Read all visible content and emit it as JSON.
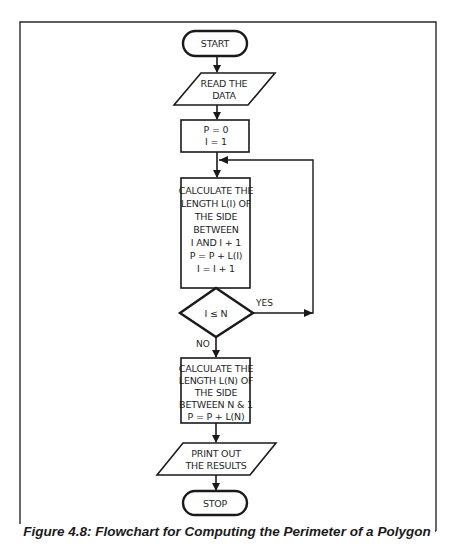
{
  "figure": {
    "caption": "Figure 4.8: Flowchart for Computing the Perimeter of a Polygon"
  },
  "flowchart": {
    "nodes": [
      {
        "id": "start",
        "shape": "terminal",
        "lines": [
          "START"
        ]
      },
      {
        "id": "read",
        "shape": "parallelogram",
        "lines": [
          "READ THE",
          "DATA"
        ]
      },
      {
        "id": "init",
        "shape": "process",
        "lines": [
          "P = 0",
          "I = 1"
        ]
      },
      {
        "id": "calc_loop",
        "shape": "process",
        "lines": [
          "CALCULATE THE",
          "LENGTH L(I) OF",
          "THE SIDE",
          "BETWEEN",
          "I AND I + 1",
          "P = P + L(I)",
          "I = I + 1"
        ]
      },
      {
        "id": "decision",
        "shape": "decision",
        "lines": [
          "I ≤ N"
        ]
      },
      {
        "id": "calc_last",
        "shape": "process",
        "lines": [
          "CALCULATE THE",
          "LENGTH L(N) OF",
          "THE SIDE",
          "BETWEEN N & 1",
          "P = P + L(N)"
        ]
      },
      {
        "id": "print",
        "shape": "parallelogram",
        "lines": [
          "PRINT OUT",
          "THE RESULTS"
        ]
      },
      {
        "id": "stop",
        "shape": "terminal",
        "lines": [
          "STOP"
        ]
      }
    ],
    "edges": [
      {
        "from": "start",
        "to": "read",
        "label": ""
      },
      {
        "from": "read",
        "to": "init",
        "label": ""
      },
      {
        "from": "init",
        "to": "calc_loop",
        "label": ""
      },
      {
        "from": "calc_loop",
        "to": "decision",
        "label": ""
      },
      {
        "from": "decision",
        "to": "calc_loop",
        "label": "YES"
      },
      {
        "from": "decision",
        "to": "calc_last",
        "label": "NO"
      },
      {
        "from": "calc_last",
        "to": "print",
        "label": ""
      },
      {
        "from": "print",
        "to": "stop",
        "label": ""
      }
    ],
    "labels": {
      "yes": "YES",
      "no": "NO"
    }
  },
  "colors": {
    "stroke": "#1a1a1a",
    "background": "#ffffff"
  }
}
